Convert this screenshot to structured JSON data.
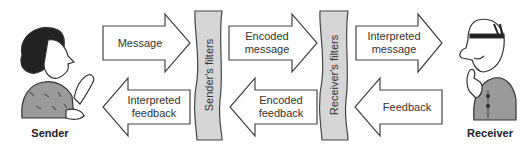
{
  "diagram": {
    "actors": {
      "sender": {
        "label": "Sender"
      },
      "receiver": {
        "label": "Receiver"
      }
    },
    "filters": {
      "sender": {
        "label": "Sender's filters"
      },
      "receiver": {
        "label": "Receiver's filters"
      }
    },
    "arrows": {
      "top": [
        {
          "label": "Message",
          "direction": "right"
        },
        {
          "label": "Encoded\nmessage",
          "direction": "right"
        },
        {
          "label": "Interpreted\nmessage",
          "direction": "right"
        }
      ],
      "bottom": [
        {
          "label": "Interpreted\nfeedback",
          "direction": "left"
        },
        {
          "label": "Encoded\nfeedback",
          "direction": "left"
        },
        {
          "label": "Feedback",
          "direction": "left"
        }
      ]
    },
    "colors": {
      "outline": "#444444",
      "filter_fill": "#d6d6d6",
      "arrow_fill": "#ffffff"
    }
  }
}
